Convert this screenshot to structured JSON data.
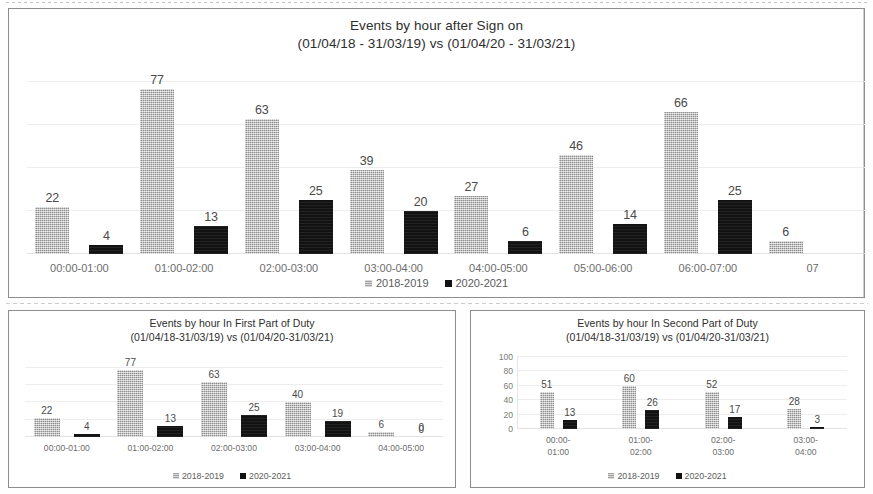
{
  "legend": {
    "series1": "2018-2019",
    "series2": "2020-2021"
  },
  "charts": {
    "main": {
      "title_line1": "Events by hour after Sign on",
      "title_line2": "(01/04/18 - 31/03/19) vs (01/04/20 - 31/03/21)"
    },
    "first_part": {
      "title_line1": "Events by hour In First Part of Duty",
      "title_line2": "(01/04/18-31/03/19) vs (01/04/20-31/03/21)"
    },
    "second_part": {
      "title_line1": "Events by hour In Second Part of Duty",
      "title_line2": "(01/04/18-31/03/19) vs (01/04/20-31/03/21)"
    }
  },
  "chart_data": [
    {
      "id": "main",
      "type": "bar",
      "title": "Events by hour after Sign on (01/04/18 - 31/03/19) vs (01/04/20 - 31/03/21)",
      "xlabel": "",
      "ylabel": "",
      "ylim": [
        0,
        90
      ],
      "grid": true,
      "legend_position": "bottom",
      "axis_visible": false,
      "note": "right edge is clipped; the eighth group is cut off mid-bar",
      "categories": [
        "00:00-01:00",
        "01:00-02:00",
        "02:00-03:00",
        "03:00-04:00",
        "04:00-05:00",
        "05:00-06:00",
        "06:00-07:00",
        "07"
      ],
      "series": [
        {
          "name": "2018-2019",
          "color": "#b4b4b4",
          "values": [
            22,
            77,
            63,
            39,
            27,
            46,
            66,
            6
          ]
        },
        {
          "name": "2020-2021",
          "color": "#121212",
          "values": [
            4,
            13,
            25,
            20,
            6,
            14,
            25,
            null
          ]
        }
      ]
    },
    {
      "id": "first_part",
      "type": "bar",
      "title": "Events by hour In First Part of Duty (01/04/18-31/03/19) vs (01/04/20-31/03/21)",
      "xlabel": "",
      "ylabel": "",
      "ylim": [
        0,
        90
      ],
      "grid": true,
      "legend_position": "bottom",
      "axis_visible": false,
      "categories": [
        "00:00-01:00",
        "01:00-02:00",
        "02:00-03:00",
        "03:00-04:00",
        "04:00-05:00"
      ],
      "series": [
        {
          "name": "2018-2019",
          "color": "#b4b4b4",
          "values": [
            22,
            77,
            63,
            40,
            6
          ]
        },
        {
          "name": "2020-2021",
          "color": "#121212",
          "values": [
            4,
            13,
            25,
            19,
            0
          ]
        }
      ]
    },
    {
      "id": "second_part",
      "type": "bar",
      "title": "Events by hour In Second Part of Duty (01/04/18-31/03/19) vs (01/04/20-31/03/21)",
      "xlabel": "",
      "ylabel": "",
      "ylim": [
        0,
        100
      ],
      "yticks": [
        100,
        80,
        60,
        40,
        20,
        0
      ],
      "grid": true,
      "legend_position": "bottom",
      "axis_visible": true,
      "categories": [
        "00:00-\n01:00",
        "01:00-\n02:00",
        "02:00-\n03:00",
        "03:00-\n04:00"
      ],
      "category_lines": [
        [
          "00:00-",
          "01:00"
        ],
        [
          "01:00-",
          "02:00"
        ],
        [
          "02:00-",
          "03:00"
        ],
        [
          "03:00-",
          "04:00"
        ]
      ],
      "series": [
        {
          "name": "2018-2019",
          "color": "#b4b4b4",
          "values": [
            51,
            60,
            52,
            28
          ]
        },
        {
          "name": "2020-2021",
          "color": "#121212",
          "values": [
            13,
            26,
            17,
            3
          ]
        }
      ]
    }
  ]
}
